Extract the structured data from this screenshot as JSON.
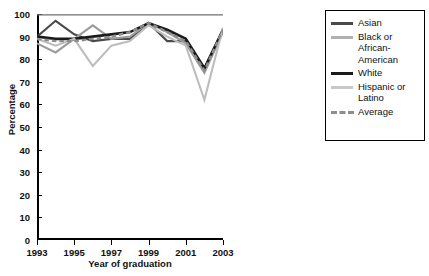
{
  "chart_data": {
    "type": "line",
    "title": "",
    "xlabel": "Year of graduation",
    "ylabel": "Percentage",
    "xlim": [
      1993,
      2003
    ],
    "ylim": [
      0,
      100
    ],
    "grid": false,
    "legend_position": "right",
    "x": [
      1993,
      1994,
      1995,
      1996,
      1997,
      1998,
      1999,
      2000,
      2001,
      2002,
      2003
    ],
    "x_tick_labels": [
      "1993",
      "1995",
      "1997",
      "1999",
      "2001",
      "2003"
    ],
    "x_ticks": [
      1993,
      1995,
      1997,
      1999,
      2001,
      2003
    ],
    "y_tick_labels": [
      "0",
      "10",
      "20",
      "30",
      "40",
      "50",
      "60",
      "70",
      "80",
      "90",
      "100"
    ],
    "y_ticks": [
      0,
      10,
      20,
      30,
      40,
      50,
      60,
      70,
      80,
      90,
      100
    ],
    "series": [
      {
        "name": "Asian",
        "color": "#4a4a4a",
        "width": 2.1,
        "dash": "none",
        "values": [
          90,
          97,
          91,
          88,
          89,
          89,
          96,
          88,
          88,
          76,
          93
        ]
      },
      {
        "name": "Black or African-American",
        "color": "#9c9c9c",
        "width": 2.1,
        "dash": "none",
        "values": [
          87,
          83,
          89,
          95,
          89,
          90,
          96,
          92,
          87,
          74,
          92
        ]
      },
      {
        "name": "White",
        "color": "#1a1a1a",
        "width": 2.6,
        "dash": "none",
        "values": [
          90,
          89,
          89,
          90,
          91,
          92,
          96,
          93,
          89,
          76,
          93
        ]
      },
      {
        "name": "Hispanic or Latino",
        "color": "#bdbdbd",
        "width": 2.1,
        "dash": "none",
        "values": [
          89,
          86,
          89,
          77,
          86,
          88,
          95,
          90,
          86,
          62,
          94
        ]
      },
      {
        "name": "Average",
        "color": "#8d8d8d",
        "width": 2.4,
        "dash": "dashed",
        "values": [
          89,
          88,
          88,
          89,
          90,
          92,
          96,
          92,
          88,
          75,
          93
        ]
      }
    ]
  },
  "legend": {
    "items": [
      {
        "label": "Asian",
        "color": "#4a4a4a",
        "dash": "none"
      },
      {
        "label": "Black or\nAfrican-\nAmerican",
        "color": "#b0b0b0",
        "dash": "none"
      },
      {
        "label": "White",
        "color": "#1a1a1a",
        "dash": "none"
      },
      {
        "label": "Hispanic or\nLatino",
        "color": "#c8c8c8",
        "dash": "none"
      },
      {
        "label": "Average",
        "color": "#8d8d8d",
        "dash": "dashed"
      }
    ]
  }
}
